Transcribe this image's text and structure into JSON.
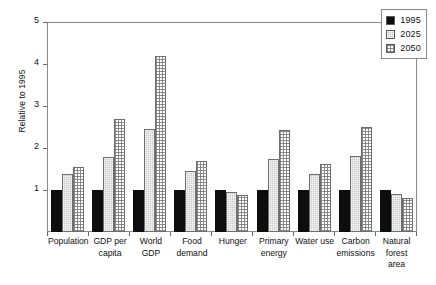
{
  "chart_data": {
    "type": "bar",
    "title": "",
    "subtitle": "",
    "xlabel": "",
    "ylabel": "Relative to 1995",
    "ylim": [
      0,
      5
    ],
    "yticks": [
      1,
      2,
      3,
      4,
      5
    ],
    "grid": false,
    "legend_position": "top-right-inside",
    "categories": [
      "Population",
      "GDP per capita",
      "World GDP",
      "Food demand",
      "Hunger",
      "Primary energy",
      "Water use",
      "Carbon emissions",
      "Natural forest area"
    ],
    "series": [
      {
        "name": "1995",
        "fill": "solid-black",
        "color": "#0d0d0d",
        "values": [
          1.0,
          1.0,
          1.0,
          1.0,
          1.0,
          1.0,
          1.0,
          1.0,
          1.0
        ]
      },
      {
        "name": "2025",
        "fill": "gray-stipple",
        "color": "#c9c9c9",
        "values": [
          1.38,
          1.78,
          2.45,
          1.45,
          0.95,
          1.75,
          1.37,
          1.8,
          0.9
        ]
      },
      {
        "name": "2050",
        "fill": "white-checker",
        "color": "#ffffff",
        "values": [
          1.55,
          2.68,
          4.2,
          1.7,
          0.87,
          2.42,
          1.62,
          2.5,
          0.82
        ]
      }
    ]
  },
  "legend": {
    "entries": [
      {
        "label": "1995",
        "swatch": "solid-black-swatch"
      },
      {
        "label": "2025",
        "swatch": "gray-stipple-swatch"
      },
      {
        "label": "2050",
        "swatch": "white-checker-swatch"
      }
    ]
  }
}
